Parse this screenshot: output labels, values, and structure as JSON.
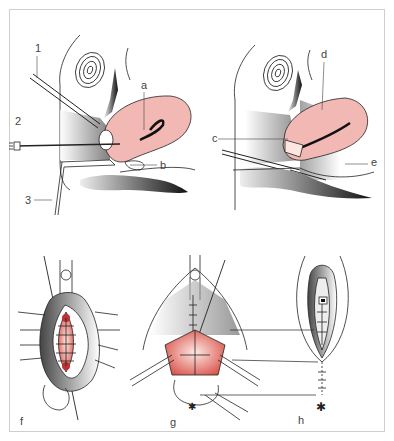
{
  "figure": {
    "type": "surgical-illustration",
    "panels": [
      {
        "id": "top-left",
        "description": "sagittal section with instruments inserted",
        "labels": [
          "1",
          "2",
          "3",
          "a",
          "b"
        ]
      },
      {
        "id": "top-right",
        "description": "sagittal section with uterus incised",
        "labels": [
          "c",
          "d",
          "e"
        ]
      },
      {
        "id": "f",
        "description": "sutured wound, frontal view",
        "label": "f"
      },
      {
        "id": "g",
        "description": "retracted wound with partial suturing",
        "label": "g"
      },
      {
        "id": "h",
        "description": "closed wound with skin suture",
        "label": "h"
      }
    ],
    "labels": {
      "n1": "1",
      "n2": "2",
      "n3": "3",
      "a": "a",
      "b": "b",
      "c": "c",
      "d": "d",
      "e": "e",
      "f": "f",
      "g": "g",
      "h": "h"
    },
    "colors": {
      "tissue_pink": "#f2b8b4",
      "wound_red": "#d9534a",
      "line": "#222222",
      "frame": "#cfcfcf"
    }
  }
}
